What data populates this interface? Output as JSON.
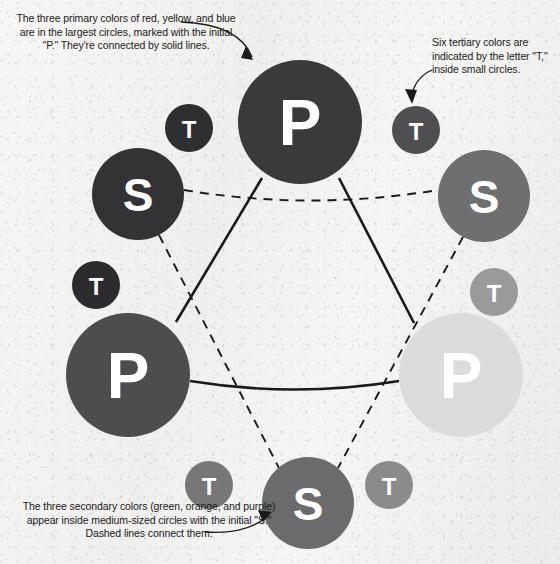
{
  "diagram": {
    "background_color": "#f4f4f2",
    "line_color": "#1a1a1a"
  },
  "annotations": [
    {
      "id": "primary-note",
      "name": "annotation-primary-colors",
      "text": "The three primary colors of red, yellow, and blue are in the largest circles, marked with the initial \"P.\" They're connected by solid lines."
    },
    {
      "id": "tertiary-note",
      "name": "annotation-tertiary-colors",
      "text": "Six tertiary colors are indicated by the letter \"T,\" inside small circles."
    },
    {
      "id": "secondary-note",
      "name": "annotation-secondary-colors",
      "text": "The three secondary colors (green, orange, and purple) appear inside medium-sized circles with the initial \"S.\" Dashed lines connect them."
    }
  ],
  "nodes": {
    "primary": [
      {
        "id": "primary-blue",
        "label": "P",
        "color_name": "blue",
        "color": "#3a3a3c",
        "cx": 300,
        "cy": 122,
        "r": 62,
        "font_size": 64
      },
      {
        "id": "primary-red",
        "label": "P",
        "color_name": "red",
        "color": "#4d4d4f",
        "cx": 128,
        "cy": 375,
        "r": 62,
        "font_size": 64
      },
      {
        "id": "primary-yellow",
        "label": "P",
        "color_name": "yellow",
        "color": "#dcdcda",
        "cx": 461,
        "cy": 375,
        "r": 62,
        "font_size": 64
      }
    ],
    "secondary": [
      {
        "id": "secondary-purple",
        "label": "S",
        "color_name": "purple",
        "color": "#333335",
        "cx": 138,
        "cy": 194,
        "r": 46,
        "font_size": 46
      },
      {
        "id": "secondary-green",
        "label": "S",
        "color_name": "green",
        "color": "#6f6f70",
        "cx": 484,
        "cy": 196,
        "r": 46,
        "font_size": 46
      },
      {
        "id": "secondary-orange",
        "label": "S",
        "color_name": "orange",
        "color": "#6b6b6c",
        "cx": 308,
        "cy": 503,
        "r": 46,
        "font_size": 46
      }
    ],
    "tertiary": [
      {
        "id": "tertiary-1",
        "label": "T",
        "color": "#2f2f31",
        "cx": 189,
        "cy": 128,
        "r": 24,
        "font_size": 24
      },
      {
        "id": "tertiary-2",
        "label": "T",
        "color": "#4f4f51",
        "cx": 416,
        "cy": 130,
        "r": 24,
        "font_size": 24
      },
      {
        "id": "tertiary-3",
        "label": "T",
        "color": "#2b2b2d",
        "cx": 96,
        "cy": 285,
        "r": 24,
        "font_size": 24
      },
      {
        "id": "tertiary-4",
        "label": "T",
        "color": "#9a9a9a",
        "cx": 494,
        "cy": 292,
        "r": 24,
        "font_size": 24
      },
      {
        "id": "tertiary-5",
        "label": "T",
        "color": "#777778",
        "cx": 209,
        "cy": 485,
        "r": 24,
        "font_size": 24
      },
      {
        "id": "tertiary-6",
        "label": "T",
        "color": "#8b8b8c",
        "cx": 389,
        "cy": 485,
        "r": 24,
        "font_size": 24
      }
    ]
  },
  "connections": {
    "solid_label": "solid lines connect primary colors",
    "dashed_label": "dashed lines connect secondary colors"
  }
}
